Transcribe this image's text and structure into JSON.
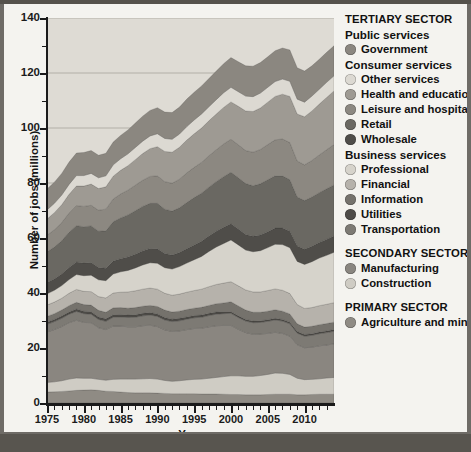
{
  "chart_data": {
    "type": "area",
    "title": "",
    "xlabel": "Year",
    "ylabel": "Number of jobs (millions)",
    "xlim": [
      1975,
      2014
    ],
    "ylim": [
      0,
      140
    ],
    "ytick_major": [
      0,
      20,
      40,
      60,
      80,
      100,
      120,
      140
    ],
    "ytick_minor": [
      10,
      30,
      50,
      70,
      90,
      110,
      130
    ],
    "xtick_major": [
      1975,
      1980,
      1985,
      1990,
      1995,
      2000,
      2005,
      2010
    ],
    "xtick_minor": [
      1976,
      1977,
      1978,
      1979,
      1981,
      1982,
      1983,
      1984,
      1986,
      1987,
      1988,
      1989,
      1991,
      1992,
      1993,
      1994,
      1996,
      1997,
      1998,
      1999,
      2001,
      2002,
      2003,
      2004,
      2006,
      2007,
      2008,
      2009,
      2011,
      2012,
      2013
    ],
    "grid": true,
    "grid_axis": "y",
    "stacked": true,
    "stack_order_bottom_to_top": [
      "Agriculture and mining",
      "Construction",
      "Manufacturing",
      "Transportation",
      "Utilities",
      "Information",
      "Financial",
      "Professional",
      "Wholesale",
      "Retail",
      "Leisure and hospitality",
      "Health and education",
      "Other services",
      "Government"
    ],
    "x": [
      1975,
      1976,
      1977,
      1978,
      1979,
      1980,
      1981,
      1982,
      1983,
      1984,
      1985,
      1986,
      1987,
      1988,
      1989,
      1990,
      1991,
      1992,
      1993,
      1994,
      1995,
      1996,
      1997,
      1998,
      1999,
      2000,
      2001,
      2002,
      2003,
      2004,
      2005,
      2006,
      2007,
      2008,
      2009,
      2010,
      2011,
      2012,
      2013,
      2014
    ],
    "series": [
      {
        "name": "Agriculture and mining",
        "color": "#8f8b84",
        "values": [
          4.0,
          4.1,
          4.2,
          4.4,
          4.6,
          4.7,
          4.8,
          4.6,
          4.3,
          4.2,
          4.0,
          3.8,
          3.7,
          3.7,
          3.7,
          3.6,
          3.5,
          3.4,
          3.4,
          3.4,
          3.4,
          3.3,
          3.3,
          3.3,
          3.2,
          3.1,
          3.1,
          3.0,
          3.0,
          3.0,
          3.1,
          3.2,
          3.2,
          3.2,
          3.0,
          3.0,
          3.1,
          3.2,
          3.2,
          3.2
        ]
      },
      {
        "name": "Construction",
        "color": "#cfccc4",
        "values": [
          3.5,
          3.6,
          3.9,
          4.3,
          4.5,
          4.3,
          4.2,
          4.0,
          4.0,
          4.4,
          4.7,
          4.9,
          5.0,
          5.1,
          5.2,
          5.1,
          4.7,
          4.5,
          4.7,
          5.0,
          5.2,
          5.4,
          5.7,
          6.0,
          6.4,
          6.8,
          6.8,
          6.7,
          6.7,
          7.0,
          7.3,
          7.7,
          7.6,
          7.2,
          6.0,
          5.5,
          5.5,
          5.6,
          5.9,
          6.1
        ]
      },
      {
        "name": "Manufacturing",
        "color": "#8a8680",
        "values": [
          18.3,
          19.0,
          19.7,
          20.5,
          21.0,
          20.3,
          20.2,
          18.8,
          18.4,
          19.4,
          19.3,
          19.0,
          19.0,
          19.3,
          19.4,
          19.1,
          18.4,
          18.1,
          18.1,
          18.3,
          18.5,
          18.5,
          18.7,
          18.8,
          18.6,
          18.3,
          16.9,
          15.9,
          15.3,
          15.1,
          14.9,
          14.8,
          14.5,
          13.9,
          12.2,
          11.6,
          11.7,
          12.0,
          12.0,
          12.2
        ]
      },
      {
        "name": "Transportation",
        "color": "#7d7a74",
        "values": [
          2.8,
          2.9,
          3.0,
          3.1,
          3.2,
          3.2,
          3.1,
          3.0,
          3.0,
          3.2,
          3.3,
          3.4,
          3.5,
          3.6,
          3.7,
          3.7,
          3.6,
          3.6,
          3.7,
          3.8,
          3.9,
          4.0,
          4.1,
          4.2,
          4.3,
          4.4,
          4.3,
          4.2,
          4.2,
          4.2,
          4.4,
          4.5,
          4.5,
          4.5,
          4.2,
          4.2,
          4.3,
          4.4,
          4.5,
          4.6
        ]
      },
      {
        "name": "Utilities",
        "color": "#4d4b47",
        "values": [
          0.8,
          0.8,
          0.8,
          0.8,
          0.9,
          0.9,
          0.9,
          0.9,
          0.9,
          0.9,
          0.9,
          0.9,
          0.9,
          0.9,
          0.9,
          0.9,
          0.9,
          0.9,
          0.9,
          0.8,
          0.8,
          0.8,
          0.8,
          0.8,
          0.7,
          0.6,
          0.6,
          0.6,
          0.6,
          0.6,
          0.6,
          0.6,
          0.6,
          0.6,
          0.6,
          0.6,
          0.6,
          0.6,
          0.6,
          0.6
        ]
      },
      {
        "name": "Information",
        "color": "#75726c",
        "values": [
          2.1,
          2.1,
          2.2,
          2.3,
          2.4,
          2.4,
          2.4,
          2.4,
          2.4,
          2.5,
          2.5,
          2.5,
          2.6,
          2.6,
          2.6,
          2.7,
          2.7,
          2.6,
          2.6,
          2.7,
          2.7,
          2.8,
          2.9,
          3.0,
          3.2,
          3.6,
          3.6,
          3.4,
          3.2,
          3.1,
          3.1,
          3.1,
          3.0,
          3.0,
          2.8,
          2.7,
          2.7,
          2.7,
          2.7,
          2.7
        ]
      },
      {
        "name": "Financial",
        "color": "#b6b2ab",
        "values": [
          4.1,
          4.2,
          4.3,
          4.5,
          4.7,
          4.8,
          4.9,
          5.0,
          5.2,
          5.4,
          5.6,
          5.9,
          6.1,
          6.2,
          6.3,
          6.3,
          6.1,
          6.1,
          6.2,
          6.3,
          6.4,
          6.6,
          6.8,
          7.0,
          7.2,
          7.3,
          7.3,
          7.3,
          7.4,
          7.4,
          7.5,
          7.6,
          7.6,
          7.4,
          7.0,
          6.8,
          6.8,
          6.9,
          7.0,
          7.1
        ]
      },
      {
        "name": "Professional",
        "color": "#d6d3cb",
        "values": [
          4.1,
          4.3,
          4.6,
          5.0,
          5.4,
          5.7,
          6.0,
          6.1,
          6.3,
          6.9,
          7.4,
          7.8,
          8.3,
          8.8,
          9.2,
          9.4,
          9.3,
          9.5,
          10.0,
          10.6,
          11.2,
          11.9,
          12.8,
          13.6,
          14.4,
          15.2,
          14.9,
          14.5,
          14.6,
          15.0,
          15.6,
          16.2,
          16.6,
          16.7,
          15.7,
          16.0,
          16.7,
          17.3,
          17.8,
          18.3
        ]
      },
      {
        "name": "Wholesale",
        "color": "#4f4d49",
        "values": [
          4.0,
          4.1,
          4.2,
          4.4,
          4.6,
          4.6,
          4.6,
          4.5,
          4.5,
          4.7,
          4.8,
          4.9,
          5.0,
          5.1,
          5.2,
          5.3,
          5.2,
          5.1,
          5.1,
          5.2,
          5.4,
          5.5,
          5.6,
          5.8,
          5.9,
          5.9,
          5.8,
          5.7,
          5.6,
          5.7,
          5.8,
          5.9,
          6.0,
          6.0,
          5.6,
          5.5,
          5.6,
          5.7,
          5.8,
          5.9
        ]
      },
      {
        "name": "Retail",
        "color": "#6a6862",
        "values": [
          11.2,
          11.6,
          12.1,
          12.8,
          13.2,
          13.2,
          13.3,
          13.2,
          13.6,
          14.3,
          14.8,
          15.3,
          15.8,
          16.2,
          16.4,
          16.5,
          16.1,
          16.0,
          16.3,
          16.8,
          17.2,
          17.5,
          17.8,
          18.0,
          18.4,
          18.7,
          18.6,
          18.5,
          18.4,
          18.6,
          18.9,
          19.0,
          19.0,
          18.7,
          17.8,
          17.7,
          17.9,
          18.1,
          18.4,
          18.6
        ]
      },
      {
        "name": "Leisure and hospitality",
        "color": "#8c8881",
        "values": [
          6.1,
          6.3,
          6.6,
          7.0,
          7.3,
          7.4,
          7.5,
          7.6,
          7.9,
          8.3,
          8.7,
          9.0,
          9.3,
          9.5,
          9.8,
          10.0,
          10.0,
          10.1,
          10.4,
          10.8,
          11.0,
          11.2,
          11.4,
          11.6,
          11.9,
          12.0,
          12.0,
          12.0,
          12.2,
          12.5,
          12.8,
          13.1,
          13.4,
          13.5,
          13.1,
          13.0,
          13.3,
          13.7,
          14.2,
          14.7
        ]
      },
      {
        "name": "Health and education",
        "color": "#9e9a93",
        "values": [
          5.9,
          6.2,
          6.5,
          6.8,
          7.1,
          7.4,
          7.7,
          7.9,
          8.1,
          8.3,
          8.6,
          8.9,
          9.3,
          9.7,
          10.1,
          10.6,
          11.0,
          11.3,
          11.6,
          11.9,
          12.2,
          12.5,
          12.7,
          13.0,
          13.3,
          13.6,
          14.0,
          14.4,
          14.8,
          15.1,
          15.4,
          15.8,
          16.3,
          16.8,
          17.1,
          17.5,
          18.0,
          18.5,
          19.0,
          19.5
        ]
      },
      {
        "name": "Other services",
        "color": "#dcd9d2",
        "values": [
          3.3,
          3.4,
          3.5,
          3.6,
          3.8,
          3.8,
          3.9,
          3.9,
          4.0,
          4.1,
          4.2,
          4.3,
          4.4,
          4.5,
          4.6,
          4.7,
          4.7,
          4.7,
          4.8,
          4.9,
          5.0,
          5.1,
          5.1,
          5.2,
          5.3,
          5.3,
          5.3,
          5.4,
          5.4,
          5.4,
          5.4,
          5.4,
          5.5,
          5.5,
          5.4,
          5.3,
          5.4,
          5.4,
          5.5,
          5.5
        ]
      },
      {
        "name": "Government",
        "color": "#8b8780",
        "values": [
          7.6,
          7.7,
          7.9,
          8.1,
          8.2,
          8.4,
          8.3,
          8.2,
          8.2,
          8.3,
          8.5,
          8.7,
          8.9,
          9.1,
          9.3,
          9.5,
          9.6,
          9.7,
          9.8,
          10.0,
          10.1,
          10.2,
          10.3,
          10.4,
          10.6,
          10.8,
          10.9,
          11.0,
          11.1,
          11.1,
          11.1,
          11.2,
          11.3,
          11.4,
          11.4,
          11.3,
          11.0,
          10.9,
          10.9,
          10.9
        ]
      }
    ],
    "legend_position": "right"
  },
  "legend": {
    "blocks": [
      {
        "type": "sector",
        "label": "TERTIARY SECTOR",
        "groups": [
          {
            "label": "Public services",
            "items": [
              {
                "label": "Government",
                "color": "#8b8780"
              }
            ]
          },
          {
            "label": "Consumer services",
            "items": [
              {
                "label": "Other services",
                "color": "#dcd9d2"
              },
              {
                "label": "Health and education",
                "color": "#9e9a93"
              },
              {
                "label": "Leisure and hospitality",
                "color": "#8c8881"
              },
              {
                "label": "Retail",
                "color": "#6a6862"
              },
              {
                "label": "Wholesale",
                "color": "#4f4d49"
              }
            ]
          },
          {
            "label": "Business services",
            "items": [
              {
                "label": "Professional",
                "color": "#d6d3cb"
              },
              {
                "label": "Financial",
                "color": "#b6b2ab"
              },
              {
                "label": "Information",
                "color": "#75726c"
              },
              {
                "label": "Utilities",
                "color": "#4d4b47"
              },
              {
                "label": "Transportation",
                "color": "#7d7a74"
              }
            ]
          }
        ]
      },
      {
        "type": "sector",
        "label": "SECONDARY SECTOR",
        "groups": [
          {
            "label": "",
            "items": [
              {
                "label": "Manufacturing",
                "color": "#8a8680"
              },
              {
                "label": "Construction",
                "color": "#cfccc4"
              }
            ]
          }
        ]
      },
      {
        "type": "sector",
        "label": "PRIMARY SECTOR",
        "groups": [
          {
            "label": "",
            "items": [
              {
                "label": "Agriculture and mining",
                "color": "#8f8b84"
              }
            ]
          }
        ]
      }
    ]
  },
  "colors": {
    "plot_background": "#dedbd4",
    "page_background": "#f4f3ef",
    "frame": "#6e6b66",
    "axis": "#1a1a1a",
    "gridline": "#a7a49d"
  }
}
